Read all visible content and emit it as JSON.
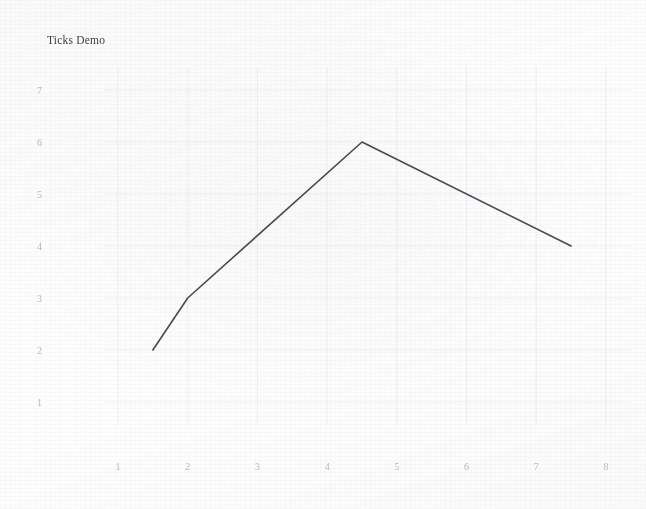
{
  "figure": {
    "title": "Ticks Demo",
    "background_color": "#fdfdfd",
    "line_color": "#4a4a52",
    "tick_label_color": "#b9bac2",
    "title_color": "#3e3e44",
    "grid_color": "#f0f0f3"
  },
  "chart_data": {
    "type": "line",
    "title": "Ticks Demo",
    "xlabel": "",
    "ylabel": "",
    "x": [
      1.5,
      2,
      4.5,
      7.5
    ],
    "y": [
      2,
      3,
      6,
      4
    ],
    "series": [
      {
        "name": "",
        "points": [
          {
            "x": 1.5,
            "y": 2
          },
          {
            "x": 2,
            "y": 3
          },
          {
            "x": 4.5,
            "y": 6
          },
          {
            "x": 7.5,
            "y": 4
          }
        ],
        "values": [
          2,
          3,
          6,
          4
        ],
        "color": "#4a4a52"
      }
    ],
    "xlim": [
      0.8,
      8.35
    ],
    "ylim": [
      0.55,
      7.45
    ],
    "xticks": [
      1,
      2,
      3,
      4,
      5,
      6,
      7,
      8
    ],
    "yticks": [
      1,
      2,
      3,
      4,
      5,
      6,
      7
    ],
    "xtick_labels": [
      "1",
      "2",
      "3",
      "4",
      "5",
      "6",
      "7",
      "8"
    ],
    "ytick_labels": [
      "1",
      "2",
      "3",
      "4",
      "5",
      "6",
      "7"
    ],
    "grid": "faint",
    "legend": "none",
    "spines": "none",
    "tick_marks": "none"
  }
}
